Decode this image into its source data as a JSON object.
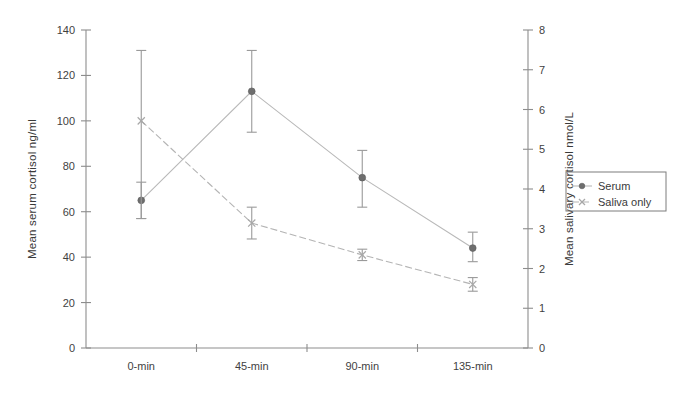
{
  "chart_data": {
    "type": "line",
    "title": "",
    "subtitle": "",
    "xlabel": "",
    "categories": [
      "0-min",
      "45-min",
      "90-min",
      "135-min"
    ],
    "grid": false,
    "legend_position": "right",
    "left_axis": {
      "label": "Mean serum cortisol ng/ml",
      "ylim": [
        0,
        140
      ],
      "ticks": [
        0,
        20,
        40,
        60,
        80,
        100,
        120,
        140
      ],
      "tick_labels": [
        "0",
        "20",
        "40",
        "60",
        "80",
        "100",
        "120",
        "140"
      ]
    },
    "right_axis": {
      "label": "Mean salivary cortisol nmol/L",
      "ylim": [
        0,
        8
      ],
      "ticks": [
        0,
        1,
        2,
        3,
        4,
        5,
        6,
        7,
        8
      ],
      "tick_labels": [
        "0",
        "1",
        "2",
        "3",
        "4",
        "5",
        "6",
        "7",
        "8"
      ]
    },
    "series": [
      {
        "name": "Serum",
        "axis": "left",
        "units": "ng/ml",
        "marker": "diamond",
        "linestyle": "solid",
        "color": "#9a9a9a",
        "values": [
          65,
          113,
          75,
          44
        ],
        "err_low": [
          57,
          95,
          62,
          38
        ],
        "err_high": [
          73,
          131,
          87,
          51
        ]
      },
      {
        "name": "Saliva only",
        "axis": "right",
        "units": "nmol/L",
        "marker": "x",
        "linestyle": "dashed",
        "color": "#a8a8a8",
        "values": [
          5.7,
          3.1,
          2.3,
          1.6
        ],
        "err_low": [
          3.3,
          2.75,
          2.2,
          1.45
        ],
        "err_high": [
          7.45,
          3.5,
          2.45,
          1.75
        ],
        "values_left_scale": [
          100,
          55,
          41,
          28
        ],
        "err_low_left_scale": [
          57,
          48,
          38.5,
          25
        ],
        "err_high_left_scale": [
          131,
          62,
          43.5,
          31
        ]
      }
    ],
    "legend": {
      "entries": [
        {
          "label": "Serum",
          "marker": "diamond",
          "linestyle": "solid"
        },
        {
          "label": "Saliva only",
          "marker": "x",
          "linestyle": "dashed"
        }
      ]
    }
  }
}
